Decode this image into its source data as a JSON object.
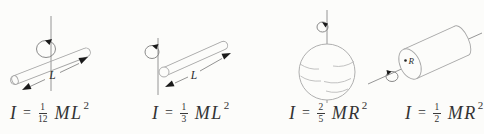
{
  "figure": {
    "depicts": "Moments of inertia of four rotating bodies with formulas"
  },
  "colors": {
    "background": "#fcfcfa",
    "shape_stroke": "#a6a6a6",
    "axis_stroke": "#8a8a8a",
    "loop_stroke": "#7d7d7d",
    "dimension_stroke": "#777777",
    "arrow_fill": "#1a1a1a",
    "formula_text": "#333333"
  },
  "panels": [
    {
      "id": "rod-about-center",
      "depicts": "thin rod rotating about axis through its center",
      "dim_label": "L",
      "formula": {
        "lhs": "I",
        "eq": "=",
        "num": "1",
        "den": "12",
        "body": "ML",
        "sup": "2"
      }
    },
    {
      "id": "rod-about-end",
      "depicts": "thin rod rotating about axis through one end",
      "dim_label": "L",
      "formula": {
        "lhs": "I",
        "eq": "=",
        "num": "1",
        "den": "3",
        "body": "ML",
        "sup": "2"
      }
    },
    {
      "id": "solid-sphere",
      "depicts": "solid sphere rotating about axis through its center",
      "dim_label": "",
      "formula": {
        "lhs": "I",
        "eq": "=",
        "num": "2",
        "den": "5",
        "body": "MR",
        "sup": "2"
      }
    },
    {
      "id": "solid-cylinder",
      "depicts": "solid cylinder rotating about its long axis",
      "dim_label": "R",
      "formula": {
        "lhs": "I",
        "eq": "=",
        "num": "1",
        "den": "2",
        "body": "MR",
        "sup": "2"
      }
    }
  ]
}
